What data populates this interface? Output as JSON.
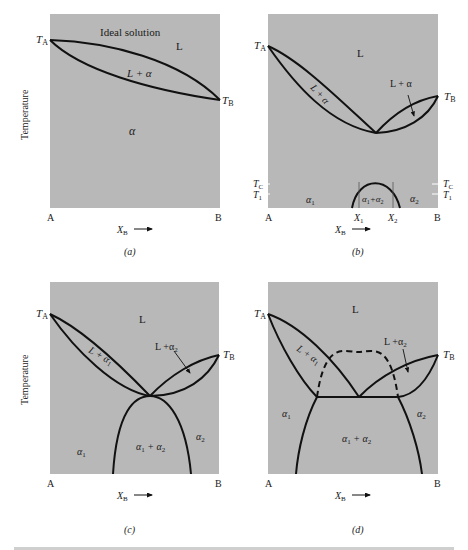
{
  "figure": {
    "y_axis_label": "Temperature",
    "panel_fill": "#b8b8b8",
    "line_color": "#111111",
    "caption_partial": "Figure (cut off)"
  },
  "panels": {
    "a": {
      "caption": "(a)",
      "corner_left": "A",
      "corner_right": "B",
      "x_axis": "X",
      "x_axis_sub": "B",
      "ta": "T",
      "ta_sub": "A",
      "tb": "T",
      "tb_sub": "B",
      "title": "Ideal solution",
      "region_L": "L",
      "region_Lalpha": "L + α",
      "region_alpha": "α"
    },
    "b": {
      "caption": "(b)",
      "corner_left": "A",
      "corner_right": "B",
      "x_axis": "X",
      "x_axis_sub": "B",
      "ta": "T",
      "ta_sub": "A",
      "tb": "T",
      "tb_sub": "B",
      "tc": "T",
      "tc_sub": "C",
      "t1": "T",
      "t1_sub": "1",
      "x1": "X",
      "x1_sub": "1",
      "x2": "X",
      "x2_sub": "2",
      "region_L": "L",
      "region_Lalpha_left": "L + α",
      "region_Lalpha_right": "L + α",
      "region_alpha1": "α",
      "region_alpha1_sub": "1",
      "region_alpha2": "α",
      "region_alpha2_sub": "2",
      "region_misc": "α",
      "region_misc_sub1": "1",
      "region_misc_plus": "+α",
      "region_misc_sub2": "2"
    },
    "c": {
      "caption": "(c)",
      "corner_left": "A",
      "corner_right": "B",
      "x_axis": "X",
      "x_axis_sub": "B",
      "ta": "T",
      "ta_sub": "A",
      "tb": "T",
      "tb_sub": "B",
      "region_L": "L",
      "region_La1": "L + α",
      "region_La1_sub": "1",
      "region_La2": "L +α",
      "region_La2_sub": "2",
      "region_a1": "α",
      "region_a1_sub": "1",
      "region_a2": "α",
      "region_a2_sub": "2",
      "region_a1a2_a": "α",
      "region_a1a2_s1": "1",
      "region_a1a2_plus": " + α",
      "region_a1a2_s2": "2"
    },
    "d": {
      "caption": "(d)",
      "corner_left": "A",
      "corner_right": "B",
      "x_axis": "X",
      "x_axis_sub": "B",
      "ta": "T",
      "ta_sub": "A",
      "tb": "T",
      "tb_sub": "B",
      "region_L": "L",
      "region_La1": "L + α",
      "region_La1_sub": "1",
      "region_La2": "L +α",
      "region_La2_sub": "2",
      "region_a1": "α",
      "region_a1_sub": "1",
      "region_a2": "α",
      "region_a2_sub": "2",
      "region_a1a2_a": "α",
      "region_a1a2_s1": "1",
      "region_a1a2_plus": " + α",
      "region_a1a2_s2": "2"
    }
  }
}
